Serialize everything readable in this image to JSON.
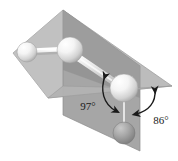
{
  "figure": {
    "annotations": [
      {
        "id": "angle-97",
        "label": "97°",
        "value": 97,
        "unit": "degrees",
        "x": 88,
        "y": 106
      },
      {
        "id": "angle-86",
        "label": "86°",
        "value": 86,
        "unit": "degrees",
        "x": 150,
        "y": 119
      }
    ],
    "atoms": [
      {
        "id": "atom-1",
        "role": "terminal-left",
        "cx": 27,
        "cy": 52,
        "r": 10,
        "shade": "light"
      },
      {
        "id": "atom-2",
        "role": "inner-left",
        "cx": 70,
        "cy": 50,
        "r": 13,
        "shade": "light"
      },
      {
        "id": "atom-3",
        "role": "inner-right",
        "cx": 124,
        "cy": 88,
        "r": 14,
        "shade": "light"
      },
      {
        "id": "atom-4",
        "role": "terminal-bottom",
        "cx": 124,
        "cy": 133,
        "r": 11,
        "shade": "dark"
      }
    ],
    "bonds": [
      {
        "id": "bond-1-2",
        "from": "atom-1",
        "to": "atom-2"
      },
      {
        "id": "bond-2-3",
        "from": "atom-2",
        "to": "atom-3"
      },
      {
        "id": "bond-3-4",
        "from": "atom-3",
        "to": "atom-4"
      }
    ],
    "planes": [
      {
        "id": "plane-horizontal",
        "orientation": "horizontal-reference-plane",
        "fill": "#b9b9b9"
      },
      {
        "id": "plane-vertical",
        "orientation": "vertical-reference-plane",
        "fill": "#a8a8a8"
      }
    ],
    "colors": {
      "plane_horizontal": "#b9b9b9",
      "plane_vertical": "#a8a8a8",
      "plane_shadow": "#8f8f8f",
      "atom_light": "#f2f2f2",
      "atom_dark": "#9a9a9a",
      "bond": "#d5d5d5",
      "annotation": "#1a1a1a",
      "background": "#ffffff"
    }
  }
}
